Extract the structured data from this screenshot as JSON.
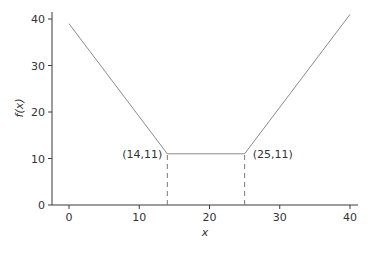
{
  "chart_data": {
    "type": "line",
    "title": "",
    "xlabel": "x",
    "ylabel": "f(x)",
    "xlim": [
      0,
      40
    ],
    "ylim": [
      0,
      40
    ],
    "x_ticks": [
      0,
      10,
      20,
      30,
      40
    ],
    "y_ticks": [
      0,
      10,
      20,
      30,
      40
    ],
    "grid": false,
    "legend": null,
    "series": [
      {
        "name": "f(x)",
        "points": [
          [
            0,
            39
          ],
          [
            14,
            11
          ],
          [
            25,
            11
          ],
          [
            40,
            41
          ]
        ]
      }
    ],
    "annotations": [
      {
        "text": "(14,11)",
        "x": 14,
        "y": 11,
        "position": "left"
      },
      {
        "text": "(25,11)",
        "x": 25,
        "y": 11,
        "position": "right"
      }
    ],
    "guides": [
      {
        "type": "vertical-dashed",
        "x": 14,
        "from_y": 0,
        "to_y": 11
      },
      {
        "type": "vertical-dashed",
        "x": 25,
        "from_y": 0,
        "to_y": 11
      }
    ]
  }
}
